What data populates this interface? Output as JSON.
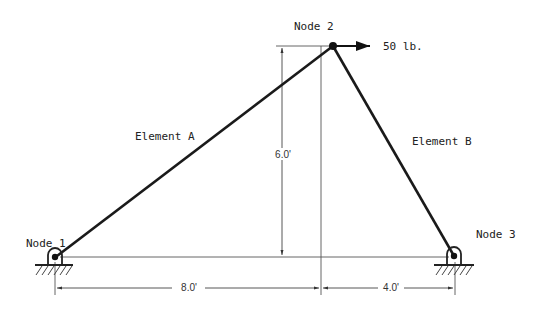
{
  "diagram": {
    "type": "truss",
    "nodes": [
      {
        "id": "node-1",
        "label": "Node 1",
        "x": 55,
        "y": 257,
        "support": "pin"
      },
      {
        "id": "node-2",
        "label": "Node 2",
        "x": 333,
        "y": 46,
        "support": "none"
      },
      {
        "id": "node-3",
        "label": "Node 3",
        "x": 454,
        "y": 257,
        "support": "pin"
      }
    ],
    "elements": [
      {
        "id": "element-a",
        "label": "Element A",
        "from": "node-1",
        "to": "node-2"
      },
      {
        "id": "element-b",
        "label": "Element B",
        "from": "node-2",
        "to": "node-3"
      }
    ],
    "load": {
      "label": "50 lb.",
      "node": "node-2",
      "direction": "right"
    },
    "dimensions": {
      "vertical": "6.0'",
      "horizontal_left": "8.0'",
      "horizontal_right": "4.0'"
    },
    "colors": {
      "member": "#1a1a1a",
      "dimension": "#444444",
      "text": "#222222"
    }
  }
}
